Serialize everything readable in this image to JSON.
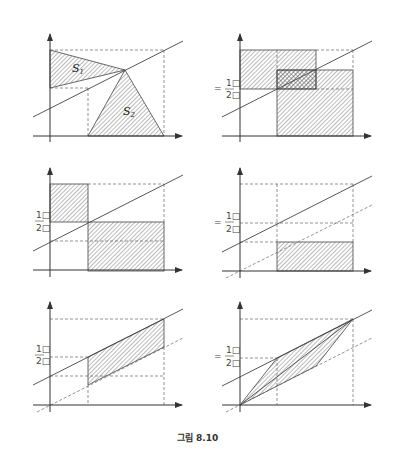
{
  "figure": {
    "caption": "그림 8.10",
    "panels": [
      {
        "id": "panel-1",
        "labels": {
          "region1": "S",
          "region1_sub": "1",
          "region2": "S",
          "region2_sub": "2"
        }
      },
      {
        "id": "panel-2",
        "labels": {
          "eq": "=",
          "num": "1□",
          "den": "2□"
        }
      },
      {
        "id": "panel-3",
        "labels": {
          "eq": "=",
          "num": "1□",
          "den": "2□"
        }
      },
      {
        "id": "panel-4",
        "labels": {
          "eq": "=",
          "num": "1□",
          "den": "2□"
        }
      },
      {
        "id": "panel-5",
        "labels": {
          "eq": "=",
          "num": "1□",
          "den": "2□"
        }
      },
      {
        "id": "panel-6",
        "labels": {
          "eq": "=",
          "num": "1□",
          "den": "2□"
        }
      }
    ]
  },
  "colors": {
    "line": "#444444",
    "hatch": "#555555",
    "background": "#ffffff"
  }
}
